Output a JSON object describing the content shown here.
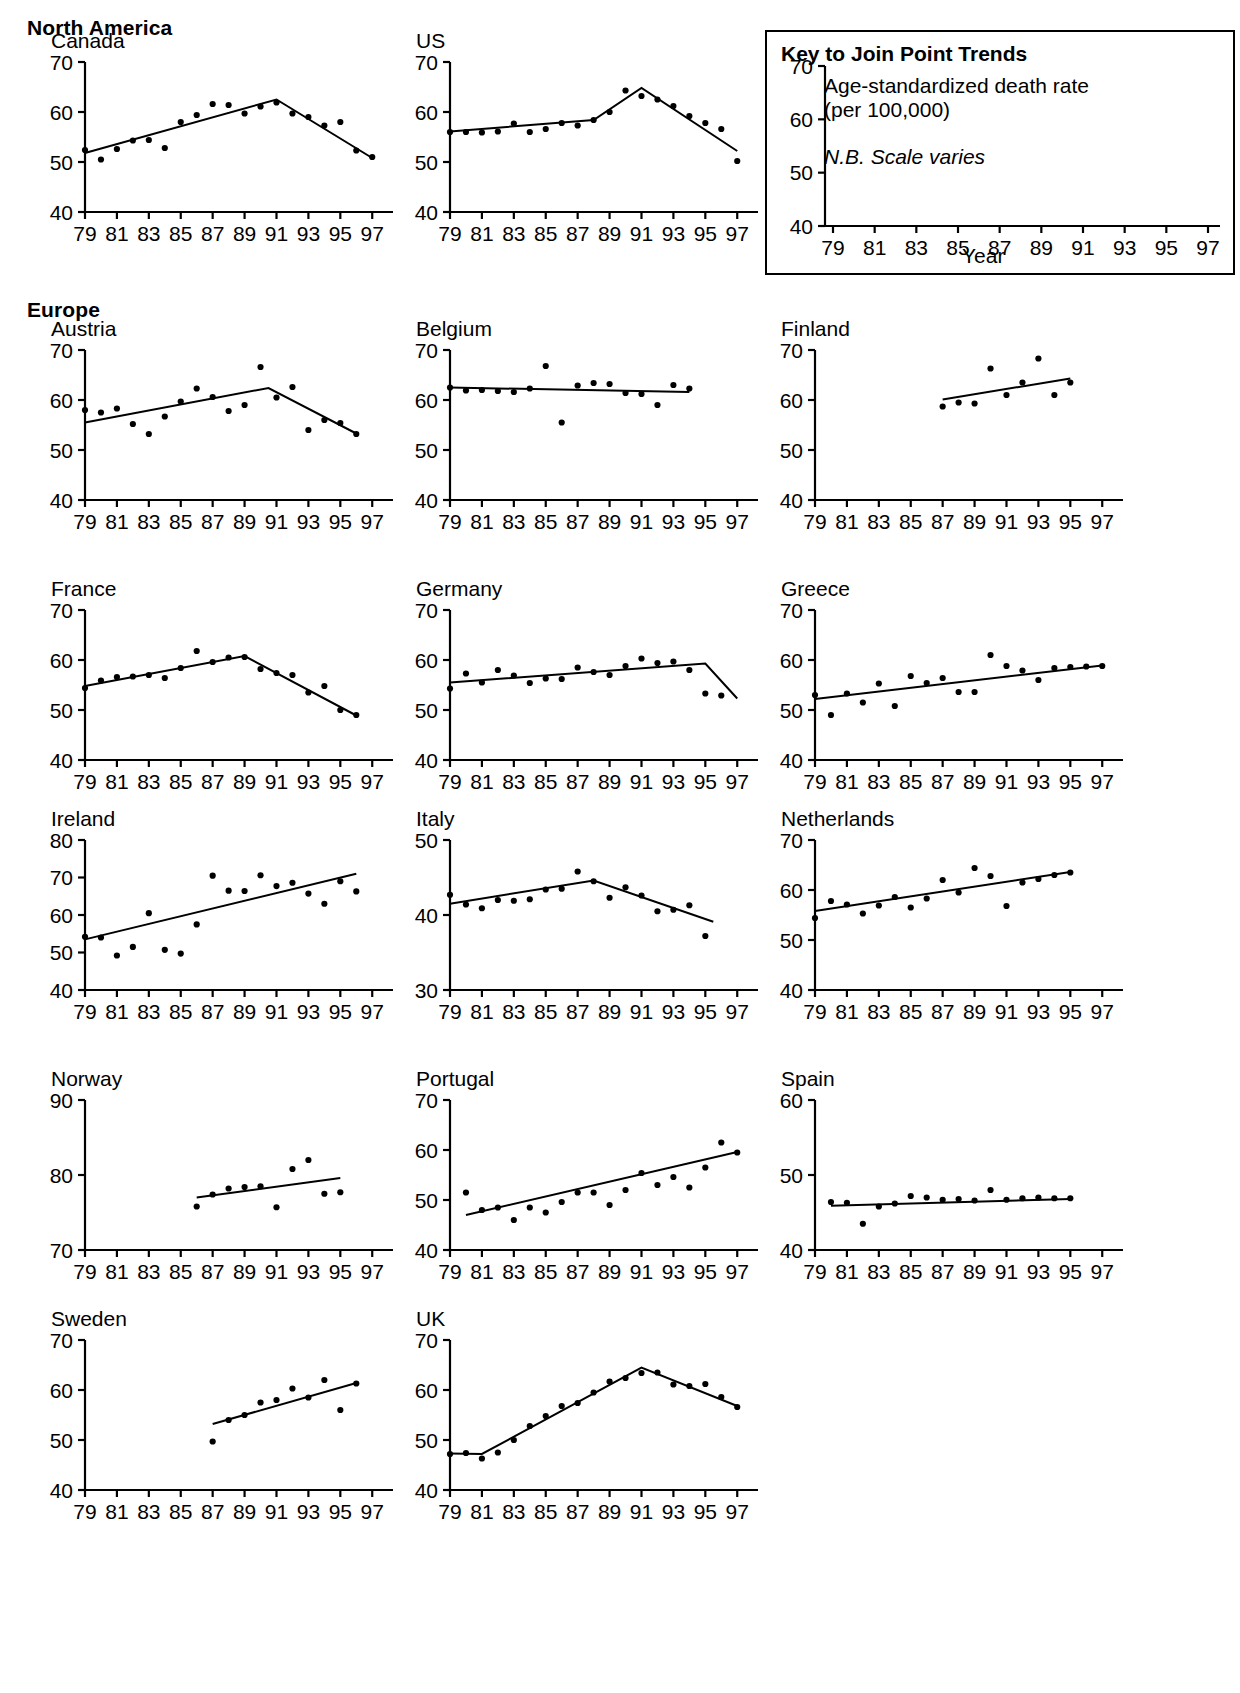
{
  "regions": [
    {
      "id": "north-america",
      "label": "North America"
    },
    {
      "id": "europe",
      "label": "Europe"
    }
  ],
  "key": {
    "title": "Key to Join Point Trends",
    "line1": "Age-standardized death rate",
    "line2": "(per 100,000)",
    "note": "N.B. Scale varies",
    "xlabel": "Year",
    "yticks": [
      "70",
      "60",
      "50",
      "40"
    ],
    "xticks": [
      "79",
      "81",
      "83",
      "85",
      "87",
      "89",
      "91",
      "93",
      "95",
      "97"
    ]
  },
  "axis": {
    "xticks": [
      "79",
      "81",
      "83",
      "85",
      "87",
      "89",
      "91",
      "93",
      "95",
      "97"
    ],
    "xmin": 79,
    "xmax": 97.8
  },
  "colors": {
    "ink": "#000000",
    "paper": "#ffffff"
  },
  "chart_data": {
    "type": "scatter",
    "xlabel": "Year",
    "ylabel": "Age-standardized death rate (per 100,000)",
    "grid": false,
    "legend": "none",
    "note": "N.B. Scale varies",
    "panels": [
      {
        "name": "Canada",
        "region": "North America",
        "ylim": [
          40,
          70
        ],
        "yticks": [
          40,
          50,
          60,
          70
        ],
        "x": [
          79,
          80,
          81,
          82,
          83,
          84,
          85,
          86,
          87,
          88,
          89,
          90,
          91,
          92,
          93,
          94,
          95,
          96,
          97
        ],
        "values": [
          52.4,
          50.5,
          52.6,
          54.3,
          54.4,
          52.8,
          58.0,
          59.4,
          61.6,
          61.4,
          59.7,
          61.1,
          61.9,
          59.7,
          59.0,
          57.3,
          58.0,
          52.3,
          51.0
        ],
        "joinpoints": [
          [
            79,
            51.8
          ],
          [
            91,
            62.5
          ],
          [
            97,
            50.8
          ]
        ]
      },
      {
        "name": "US",
        "region": "North America",
        "ylim": [
          40,
          70
        ],
        "yticks": [
          40,
          50,
          60,
          70
        ],
        "x": [
          79,
          80,
          81,
          82,
          83,
          84,
          85,
          86,
          87,
          88,
          89,
          90,
          91,
          92,
          93,
          94,
          95,
          96,
          97
        ],
        "values": [
          56.0,
          56.0,
          55.9,
          56.1,
          57.7,
          56.0,
          56.6,
          57.8,
          57.3,
          58.4,
          60.0,
          64.3,
          63.2,
          62.5,
          61.2,
          59.2,
          57.8,
          56.6,
          50.2
        ],
        "joinpoints": [
          [
            79,
            56.1
          ],
          [
            88,
            58.4
          ],
          [
            91,
            64.8
          ],
          [
            97,
            52.2
          ]
        ]
      },
      {
        "name": "Austria",
        "region": "Europe",
        "ylim": [
          40,
          70
        ],
        "yticks": [
          40,
          50,
          60,
          70
        ],
        "x": [
          79,
          80,
          81,
          82,
          83,
          84,
          85,
          86,
          87,
          88,
          89,
          90,
          91,
          92,
          93,
          94,
          95,
          96
        ],
        "values": [
          58.0,
          57.5,
          58.3,
          55.2,
          53.2,
          56.7,
          59.7,
          62.3,
          60.6,
          57.8,
          59.0,
          66.6,
          60.5,
          62.6,
          54.0,
          56.0,
          55.4,
          53.2
        ],
        "joinpoints": [
          [
            79,
            55.5
          ],
          [
            90.5,
            62.4
          ],
          [
            96,
            53.3
          ]
        ]
      },
      {
        "name": "Belgium",
        "region": "Europe",
        "ylim": [
          40,
          70
        ],
        "yticks": [
          40,
          50,
          60,
          70
        ],
        "x": [
          79,
          80,
          81,
          82,
          83,
          84,
          85,
          86,
          87,
          88,
          89,
          90,
          91,
          92,
          93,
          94
        ],
        "values": [
          62.5,
          61.9,
          62.0,
          61.8,
          61.6,
          62.3,
          66.8,
          55.5,
          62.9,
          63.4,
          63.2,
          61.4,
          61.2,
          59.0,
          63.0,
          62.3
        ],
        "joinpoints": [
          [
            79,
            62.5
          ],
          [
            94,
            61.6
          ]
        ]
      },
      {
        "name": "Finland",
        "region": "Europe",
        "ylim": [
          40,
          70
        ],
        "yticks": [
          40,
          50,
          60,
          70
        ],
        "x": [
          87,
          88,
          89,
          90,
          91,
          92,
          93,
          94,
          95
        ],
        "values": [
          58.7,
          59.5,
          59.3,
          66.3,
          61.0,
          63.5,
          68.3,
          61.0,
          63.5
        ],
        "joinpoints": [
          [
            87,
            60.1
          ],
          [
            95,
            64.3
          ]
        ]
      },
      {
        "name": "France",
        "region": "Europe",
        "ylim": [
          40,
          70
        ],
        "yticks": [
          40,
          50,
          60,
          70
        ],
        "x": [
          79,
          80,
          81,
          82,
          83,
          84,
          85,
          86,
          87,
          88,
          89,
          90,
          91,
          92,
          93,
          94,
          95,
          96
        ],
        "values": [
          54.4,
          55.9,
          56.6,
          56.7,
          57.0,
          56.4,
          58.4,
          61.8,
          59.6,
          60.5,
          60.6,
          58.2,
          57.4,
          57.0,
          53.5,
          54.8,
          50.0,
          49.0
        ],
        "joinpoints": [
          [
            79,
            54.8
          ],
          [
            89,
            60.8
          ],
          [
            96,
            48.9
          ]
        ]
      },
      {
        "name": "Germany",
        "region": "Europe",
        "ylim": [
          40,
          70
        ],
        "yticks": [
          40,
          50,
          60,
          70
        ],
        "x": [
          79,
          80,
          81,
          82,
          83,
          84,
          85,
          86,
          87,
          88,
          89,
          90,
          91,
          92,
          93,
          94,
          95,
          96
        ],
        "values": [
          54.3,
          57.3,
          55.5,
          58.0,
          56.9,
          55.4,
          56.3,
          56.2,
          58.5,
          57.6,
          57.0,
          58.8,
          60.3,
          59.4,
          59.7,
          58.0,
          53.3,
          52.9
        ],
        "joinpoints": [
          [
            79,
            55.5
          ],
          [
            95,
            59.3
          ],
          [
            97,
            52.3
          ]
        ]
      },
      {
        "name": "Greece",
        "region": "Europe",
        "ylim": [
          40,
          70
        ],
        "yticks": [
          40,
          50,
          60,
          70
        ],
        "x": [
          79,
          80,
          81,
          82,
          83,
          84,
          85,
          86,
          87,
          88,
          89,
          90,
          91,
          92,
          93,
          94,
          95,
          96,
          97
        ],
        "values": [
          53.0,
          49.0,
          53.3,
          51.5,
          55.3,
          50.8,
          56.8,
          55.4,
          56.4,
          53.6,
          53.6,
          61.0,
          58.8,
          57.9,
          56.0,
          58.4,
          58.6,
          58.7,
          58.8
        ],
        "joinpoints": [
          [
            79,
            52.2
          ],
          [
            97,
            58.9
          ]
        ]
      },
      {
        "name": "Ireland",
        "region": "Europe",
        "ylim": [
          40,
          80
        ],
        "yticks": [
          40,
          50,
          60,
          70,
          80
        ],
        "x": [
          79,
          80,
          81,
          82,
          83,
          84,
          85,
          86,
          87,
          88,
          89,
          90,
          91,
          92,
          93,
          94,
          95,
          96
        ],
        "values": [
          54.2,
          54.0,
          49.2,
          51.5,
          60.5,
          50.7,
          49.7,
          57.5,
          70.5,
          66.5,
          66.4,
          70.6,
          67.7,
          68.6,
          65.7,
          63.0,
          69.0,
          66.3
        ],
        "joinpoints": [
          [
            79,
            53.5
          ],
          [
            96,
            71.0
          ]
        ]
      },
      {
        "name": "Italy",
        "region": "Europe",
        "ylim": [
          30,
          50
        ],
        "yticks": [
          30,
          40,
          50
        ],
        "x": [
          79,
          80,
          81,
          82,
          83,
          84,
          85,
          86,
          87,
          88,
          89,
          90,
          91,
          92,
          93,
          94,
          95
        ],
        "values": [
          42.7,
          41.4,
          40.9,
          42.0,
          41.9,
          42.1,
          43.4,
          43.5,
          45.8,
          44.5,
          42.3,
          43.7,
          42.6,
          40.5,
          40.7,
          41.3,
          37.2
        ],
        "joinpoints": [
          [
            79,
            41.5
          ],
          [
            88,
            44.6
          ],
          [
            95.5,
            39.1
          ]
        ]
      },
      {
        "name": "Netherlands",
        "region": "Europe",
        "ylim": [
          40,
          70
        ],
        "yticks": [
          40,
          50,
          60,
          70
        ],
        "x": [
          79,
          80,
          81,
          82,
          83,
          84,
          85,
          86,
          87,
          88,
          89,
          90,
          91,
          92,
          93,
          94,
          95
        ],
        "values": [
          54.4,
          57.8,
          57.1,
          55.3,
          56.9,
          58.6,
          56.5,
          58.3,
          62.0,
          59.5,
          64.4,
          62.8,
          56.8,
          61.5,
          62.2,
          63.0,
          63.5
        ],
        "joinpoints": [
          [
            79,
            55.8
          ],
          [
            95,
            63.6
          ]
        ]
      },
      {
        "name": "Norway",
        "region": "Europe",
        "ylim": [
          70,
          90
        ],
        "yticks": [
          70,
          80,
          90
        ],
        "x": [
          86,
          87,
          88,
          89,
          90,
          91,
          92,
          93,
          94,
          95
        ],
        "values": [
          75.8,
          77.4,
          78.2,
          78.4,
          78.5,
          75.7,
          80.8,
          82.0,
          77.5,
          77.7
        ],
        "joinpoints": [
          [
            86,
            77.0
          ],
          [
            95,
            79.6
          ]
        ]
      },
      {
        "name": "Portugal",
        "region": "Europe",
        "ylim": [
          40,
          70
        ],
        "yticks": [
          40,
          50,
          60,
          70
        ],
        "x": [
          80,
          81,
          82,
          83,
          84,
          85,
          86,
          87,
          88,
          89,
          90,
          91,
          92,
          93,
          94,
          95,
          96,
          97
        ],
        "values": [
          51.5,
          48.0,
          48.5,
          46.0,
          48.5,
          47.5,
          49.6,
          51.5,
          51.5,
          49.0,
          52.0,
          55.4,
          53.0,
          54.6,
          52.5,
          56.5,
          61.5,
          59.5
        ],
        "joinpoints": [
          [
            80,
            47.0
          ],
          [
            97,
            59.6
          ]
        ]
      },
      {
        "name": "Spain",
        "region": "Europe",
        "ylim": [
          40,
          60
        ],
        "yticks": [
          40,
          50,
          60
        ],
        "x": [
          80,
          81,
          82,
          83,
          84,
          85,
          86,
          87,
          88,
          89,
          90,
          91,
          92,
          93,
          94,
          95
        ],
        "values": [
          46.4,
          46.3,
          43.5,
          45.8,
          46.2,
          47.2,
          47.0,
          46.7,
          46.8,
          46.6,
          48.0,
          46.7,
          46.9,
          47.0,
          46.9,
          46.9
        ],
        "joinpoints": [
          [
            80,
            45.9
          ],
          [
            95,
            46.8
          ]
        ]
      },
      {
        "name": "Sweden",
        "region": "Europe",
        "ylim": [
          40,
          70
        ],
        "yticks": [
          40,
          50,
          60,
          70
        ],
        "x": [
          87,
          88,
          89,
          90,
          91,
          92,
          93,
          94,
          95,
          96
        ],
        "values": [
          49.7,
          54.0,
          55.0,
          57.5,
          58.0,
          60.3,
          58.5,
          62.0,
          56.0,
          61.3
        ],
        "joinpoints": [
          [
            87,
            53.2
          ],
          [
            96,
            61.4
          ]
        ]
      },
      {
        "name": "UK",
        "region": "Europe",
        "ylim": [
          40,
          70
        ],
        "yticks": [
          40,
          50,
          60,
          70
        ],
        "x": [
          79,
          80,
          81,
          82,
          83,
          84,
          85,
          86,
          87,
          88,
          89,
          90,
          91,
          92,
          93,
          94,
          95,
          96,
          97
        ],
        "values": [
          47.2,
          47.4,
          46.3,
          47.5,
          50.0,
          52.8,
          54.8,
          56.8,
          57.4,
          59.5,
          61.7,
          62.4,
          63.4,
          63.5,
          61.1,
          60.8,
          61.2,
          58.6,
          56.6
        ],
        "joinpoints": [
          [
            79,
            47.3
          ],
          [
            81,
            47.2
          ],
          [
            91,
            64.5
          ],
          [
            97,
            56.8
          ]
        ]
      }
    ]
  }
}
